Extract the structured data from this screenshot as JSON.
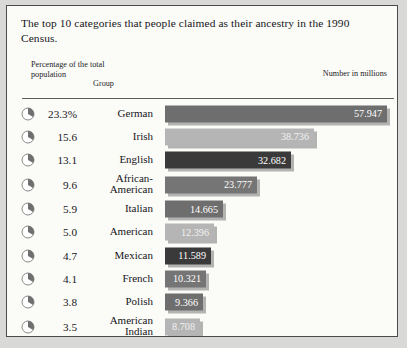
{
  "figure": {
    "caption": "The top 10 categories that people claimed as their ancestry in the 1990 Census.",
    "headers": {
      "percent": "Percentage of the total population",
      "group": "Group",
      "number": "Number in millions"
    }
  },
  "chart_data": {
    "type": "bar",
    "title": "The top 10 categories that people claimed as their ancestry in the 1990 Census.",
    "xlabel": "Number in millions",
    "ylabel": "Group",
    "orientation": "horizontal",
    "grid": false,
    "legend": "none",
    "xlim": [
      0,
      57.947
    ],
    "categories": [
      "German",
      "Irish",
      "English",
      "African-American",
      "Italian",
      "American",
      "Mexican",
      "French",
      "Polish",
      "American Indian"
    ],
    "values": [
      57.947,
      38.736,
      32.682,
      23.777,
      14.665,
      12.396,
      11.589,
      10.321,
      9.366,
      8.708
    ],
    "percent_of_total_population": [
      "23.3%",
      "15.6",
      "13.1",
      "9.6",
      "5.9",
      "5.0",
      "4.7",
      "4.1",
      "3.8",
      "3.5"
    ],
    "value_labels": [
      "57.947",
      "38.736",
      "32.682",
      "23.777",
      "14.665",
      "12.396",
      "11.589",
      "10.321",
      "9.366",
      "8.708"
    ],
    "bar_colors": [
      "#6e6e6e",
      "#b5b5b5",
      "#3a3a3a",
      "#757575",
      "#6e6e6e",
      "#b5b5b5",
      "#3a3a3a",
      "#757575",
      "#6e6e6e",
      "#b5b5b5"
    ]
  },
  "rows": [
    {
      "percent": "23.3%",
      "group": "German",
      "value": "57.947",
      "width": 222,
      "color": "#6e6e6e",
      "light": false,
      "icon": "pie-chart-icon",
      "tall": false
    },
    {
      "percent": "15.6",
      "group": "Irish",
      "value": "38.736",
      "width": 149,
      "color": "#b5b5b5",
      "light": true,
      "icon": "pie-chart-icon",
      "tall": false
    },
    {
      "percent": "13.1",
      "group": "English",
      "value": "32.682",
      "width": 126,
      "color": "#3a3a3a",
      "light": false,
      "icon": "pie-chart-icon",
      "tall": false
    },
    {
      "percent": "9.6",
      "group": "African-American",
      "value": "23.777",
      "width": 92,
      "color": "#757575",
      "light": false,
      "icon": "pie-chart-icon",
      "tall": true
    },
    {
      "percent": "5.9",
      "group": "Italian",
      "value": "14.665",
      "width": 58,
      "color": "#6e6e6e",
      "light": false,
      "icon": "pie-chart-icon",
      "tall": false
    },
    {
      "percent": "5.0",
      "group": "American",
      "value": "12.396",
      "width": 49,
      "color": "#b5b5b5",
      "light": true,
      "icon": "pie-chart-icon",
      "tall": false
    },
    {
      "percent": "4.7",
      "group": "Mexican",
      "value": "11.589",
      "width": 46,
      "color": "#3a3a3a",
      "light": false,
      "icon": "pie-chart-icon",
      "tall": false
    },
    {
      "percent": "4.1",
      "group": "French",
      "value": "10.321",
      "width": 41,
      "color": "#757575",
      "light": false,
      "icon": "pie-chart-icon",
      "tall": false
    },
    {
      "percent": "3.8",
      "group": "Polish",
      "value": "9.366",
      "width": 38,
      "color": "#6e6e6e",
      "light": false,
      "icon": "pie-chart-icon",
      "tall": false
    },
    {
      "percent": "3.5",
      "group": "American Indian",
      "value": "8.708",
      "width": 35,
      "color": "#b5b5b5",
      "light": true,
      "icon": "pie-chart-icon",
      "tall": true
    }
  ]
}
